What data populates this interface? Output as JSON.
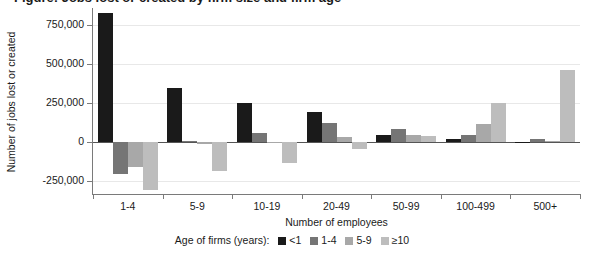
{
  "title": "Figure: Jobs lost or created by firm size and firm age",
  "chart_data": {
    "type": "bar",
    "title": "Figure: Jobs lost or created by firm size and firm age",
    "xlabel": "Number of employees",
    "ylabel": "Number of jobs lost or created",
    "legend_title": "Age of firms (years):",
    "legend_position": "bottom",
    "grid": true,
    "ylim": [
      -330000,
      860000
    ],
    "yticks": [
      750000,
      500000,
      250000,
      0,
      -250000
    ],
    "ytick_labels": [
      "750,000",
      "500,000",
      "250,000",
      "0",
      "-250,000"
    ],
    "categories": [
      "1-4",
      "5-9",
      "10-19",
      "20-49",
      "50-99",
      "100-499",
      "500+"
    ],
    "series": [
      {
        "name": "<1",
        "color": "#1a1a1a",
        "values": [
          830000,
          345000,
          255000,
          195000,
          45000,
          20000,
          5000
        ]
      },
      {
        "name": "1-4",
        "color": "#757575",
        "values": [
          -205000,
          10000,
          60000,
          125000,
          85000,
          45000,
          20000
        ]
      },
      {
        "name": "5-9",
        "color": "#a8a8a8",
        "values": [
          -155000,
          -10000,
          -5000,
          35000,
          45000,
          120000,
          10000
        ]
      },
      {
        "name": "≥10",
        "color": "#bdbdbd",
        "values": [
          -305000,
          -185000,
          -130000,
          -45000,
          40000,
          255000,
          465000
        ]
      }
    ]
  }
}
